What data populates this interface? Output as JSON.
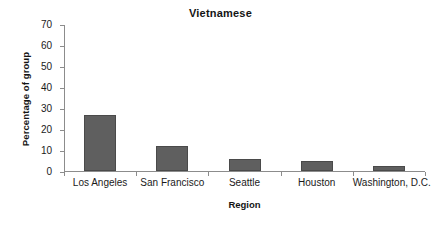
{
  "chart_data": {
    "type": "bar",
    "title": "Vietnamese",
    "xlabel": "Region",
    "ylabel": "Percentage of group",
    "categories": [
      "Los Angeles",
      "San Francisco",
      "Seattle",
      "Houston",
      "Washington, D.C."
    ],
    "values": [
      26.8,
      12.0,
      5.7,
      4.8,
      2.6
    ],
    "ylim": [
      0,
      70
    ],
    "yticks": [
      0,
      10,
      20,
      30,
      40,
      50,
      60,
      70
    ],
    "ytick_labels": [
      "0",
      "10",
      "20",
      "30",
      "40",
      "50",
      "60",
      "70"
    ],
    "grid": false,
    "legend": false,
    "series_color": "#5f5f5f",
    "axis_color": "#8c8c8c"
  }
}
